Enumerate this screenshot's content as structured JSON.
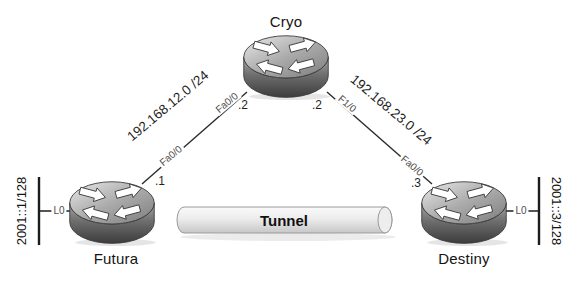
{
  "diagram": {
    "type": "network-topology",
    "routers": [
      {
        "name": "Cryo"
      },
      {
        "name": "Futura"
      },
      {
        "name": "Destiny"
      }
    ],
    "links": [
      {
        "network": "192.168.12.0 /24",
        "near_if": "Fa0/0",
        "near_ip": ".1",
        "far_if": "Fa0/0",
        "far_ip": ".2",
        "endpoints": [
          "Futura",
          "Cryo"
        ]
      },
      {
        "network": "192.168.23.0 /24",
        "near_if": "F1/0",
        "near_ip": ".2",
        "far_if": "Fa0/0",
        "far_ip": ".3",
        "endpoints": [
          "Cryo",
          "Destiny"
        ]
      }
    ],
    "tunnel": {
      "label": "Tunnel"
    },
    "loopbacks": [
      {
        "interface": "L0",
        "address": "2001::1/128",
        "router": "Futura"
      },
      {
        "interface": "L0",
        "address": "2001::3/128",
        "router": "Destiny"
      }
    ],
    "colors": {
      "line": "#2b2b2b",
      "text": "#1a1a1a",
      "interface_text": "#4d4d4d",
      "router_body": "#6e6e6e",
      "tunnel_fill": "#ececec"
    }
  }
}
